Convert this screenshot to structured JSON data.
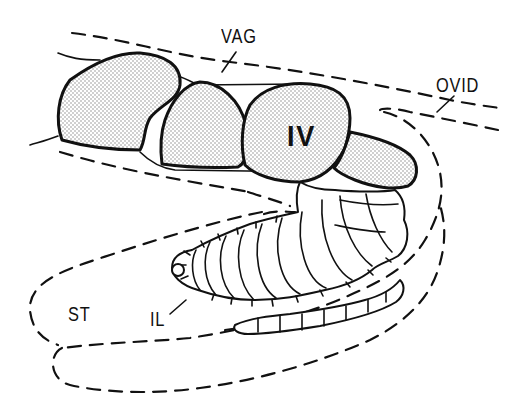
{
  "figure": {
    "type": "anatomical line drawing",
    "labels": {
      "vagina": "VAG",
      "oviduct": "OVID",
      "egg_stage": "IV",
      "sac": "ST",
      "larva": "IL"
    },
    "colors": {
      "ink": "#111111",
      "background": "#ffffff",
      "stipple": "#9a9a9a"
    }
  }
}
